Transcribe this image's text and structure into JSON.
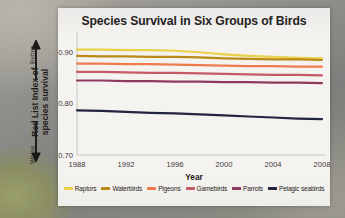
{
  "chart_data": {
    "type": "line",
    "title": "Species Survival in Six Groups of Birds",
    "xlabel": "Year",
    "ylabel": "Red List Index of species survival",
    "xlim": [
      1988,
      2008
    ],
    "ylim": [
      0.7,
      0.92
    ],
    "grid": false,
    "legend_position": "bottom",
    "x_ticks": [
      "1988",
      "1992",
      "1996",
      "2000",
      "2004",
      "2008"
    ],
    "y_ticks": [
      "0.90",
      "0.80",
      "0.70"
    ],
    "axis_direction_labels": {
      "top": "Better",
      "bottom": "Worse"
    },
    "x": [
      1988,
      1990,
      1992,
      1994,
      1996,
      1998,
      2000,
      2002,
      2004,
      2006,
      2008
    ],
    "series": [
      {
        "name": "Raptors",
        "color": "#e8d24a",
        "values": [
          0.905,
          0.905,
          0.904,
          0.904,
          0.903,
          0.9,
          0.896,
          0.893,
          0.891,
          0.889,
          0.888
        ]
      },
      {
        "name": "Waterbirds",
        "color": "#b98a15",
        "values": [
          0.893,
          0.892,
          0.892,
          0.891,
          0.891,
          0.89,
          0.888,
          0.887,
          0.886,
          0.886,
          0.885
        ]
      },
      {
        "name": "Pigeons",
        "color": "#ee7b4e",
        "values": [
          0.878,
          0.878,
          0.877,
          0.877,
          0.876,
          0.875,
          0.874,
          0.873,
          0.873,
          0.872,
          0.872
        ]
      },
      {
        "name": "Gamebirds",
        "color": "#c85a66",
        "values": [
          0.862,
          0.862,
          0.861,
          0.86,
          0.86,
          0.859,
          0.858,
          0.857,
          0.856,
          0.856,
          0.855
        ]
      },
      {
        "name": "Parrots",
        "color": "#8e3a5e",
        "values": [
          0.845,
          0.845,
          0.844,
          0.844,
          0.843,
          0.843,
          0.842,
          0.842,
          0.841,
          0.841,
          0.84
        ]
      },
      {
        "name": "Pelagic seabirds",
        "color": "#23243f",
        "values": [
          0.787,
          0.786,
          0.784,
          0.782,
          0.781,
          0.779,
          0.777,
          0.775,
          0.773,
          0.771,
          0.77
        ]
      }
    ]
  }
}
